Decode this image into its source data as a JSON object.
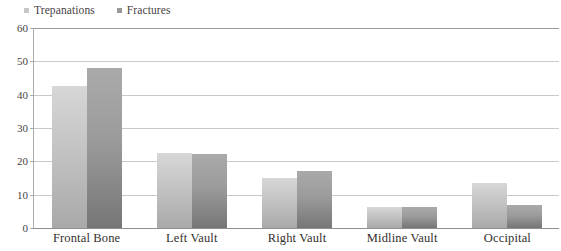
{
  "chart_data": {
    "type": "bar",
    "title": "",
    "subtitle": "",
    "xlabel": "",
    "ylabel": "",
    "categories": [
      "Frontal Bone",
      "Left Vault",
      "Right Vault",
      "Midline Vault",
      "Occipital"
    ],
    "series": [
      {
        "name": "Trepanations",
        "color": "#c6c6c6",
        "values": [
          42.6,
          22.6,
          15.1,
          6.2,
          13.4
        ]
      },
      {
        "name": "Fractures",
        "color": "#999999",
        "values": [
          48.0,
          22.3,
          17.0,
          6.2,
          7.0
        ]
      }
    ],
    "ylim": [
      0,
      60
    ],
    "yticks": [
      0,
      10,
      20,
      30,
      40,
      50,
      60
    ],
    "ytick_labels": [
      "0",
      "10",
      "20",
      "30",
      "40",
      "50",
      "60"
    ],
    "grid": true,
    "grid_axis": "y",
    "legend": {
      "position": "top-left",
      "entries": [
        {
          "label": "Trepanations",
          "swatch": "#c6c6c6"
        },
        {
          "label": "Fractures",
          "swatch": "#999999"
        }
      ]
    },
    "colors": {
      "gridline": "#c9c9c9",
      "axis": "#9a9a9a",
      "text": "#3a3a3a",
      "background": "#ffffff"
    }
  }
}
